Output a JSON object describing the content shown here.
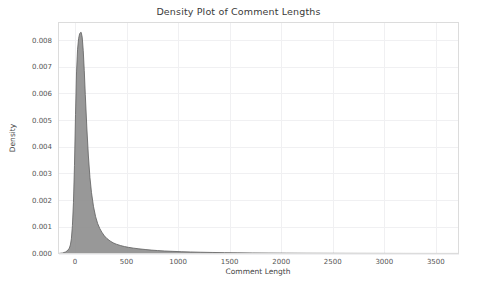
{
  "chart_data": {
    "type": "area",
    "title": "Density Plot of Comment Lengths",
    "xlabel": "Comment Length",
    "ylabel": "Density",
    "xlim": [
      -160,
      3720
    ],
    "ylim": [
      0,
      0.00865
    ],
    "grid": true,
    "legend": "none",
    "fill_color": "#8f8f8f",
    "line_color": "#5e5e5e",
    "grid_color": "#f0f0f2",
    "border_color": "#dcdcdc",
    "background_color": "#ffffff",
    "xticks": [
      0,
      500,
      1000,
      1500,
      2000,
      2500,
      3000,
      3500
    ],
    "xtick_labels": [
      "0",
      "500",
      "1000",
      "1500",
      "2000",
      "2500",
      "3000",
      "3500"
    ],
    "yticks": [
      0.0,
      0.001,
      0.002,
      0.003,
      0.004,
      0.005,
      0.006,
      0.007,
      0.008
    ],
    "ytick_labels": [
      "0.000",
      "0.001",
      "0.002",
      "0.003",
      "0.004",
      "0.005",
      "0.006",
      "0.007",
      "0.008"
    ],
    "peak_x": 60,
    "peak_y": 0.00828,
    "x": [
      -160,
      -120,
      -90,
      -70,
      -55,
      -45,
      -35,
      -25,
      -15,
      -5,
      5,
      15,
      25,
      35,
      45,
      55,
      60,
      70,
      80,
      90,
      100,
      115,
      130,
      145,
      160,
      180,
      200,
      220,
      240,
      260,
      285,
      310,
      340,
      370,
      400,
      440,
      480,
      520,
      570,
      620,
      680,
      740,
      800,
      870,
      950,
      1030,
      1120,
      1220,
      1330,
      1450,
      1580,
      1720,
      1880,
      2050,
      2250,
      2450,
      2700,
      2950,
      3200,
      3450,
      3720
    ],
    "y": [
      0.0,
      2e-05,
      6e-05,
      0.00012,
      0.0002,
      0.00032,
      0.00055,
      0.00105,
      0.0019,
      0.0033,
      0.0052,
      0.0068,
      0.00765,
      0.00805,
      0.00823,
      0.00828,
      0.00828,
      0.0081,
      0.0076,
      0.00685,
      0.00595,
      0.0047,
      0.00365,
      0.00285,
      0.00228,
      0.00175,
      0.00138,
      0.00112,
      0.00094,
      0.0008,
      0.00066,
      0.00056,
      0.00047,
      0.0004,
      0.00035,
      0.0003,
      0.00026,
      0.00023,
      0.0002,
      0.000175,
      0.00015,
      0.000128,
      0.00011,
      9.4e-05,
      8e-05,
      6.8e-05,
      5.7e-05,
      4.7e-05,
      3.9e-05,
      3.2e-05,
      2.6e-05,
      2.1e-05,
      1.65e-05,
      1.28e-05,
      9.5e-06,
      7.2e-06,
      5.2e-06,
      3.6e-06,
      2.4e-06,
      1.5e-06,
      8e-07
    ]
  }
}
